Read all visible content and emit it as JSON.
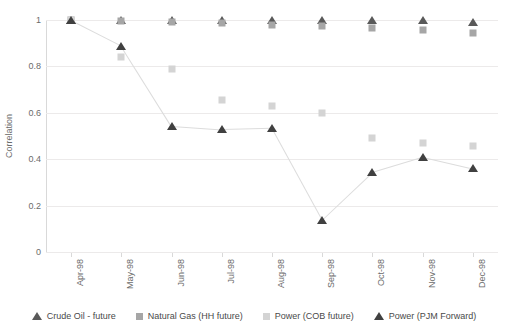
{
  "chart_data": {
    "type": "scatter",
    "title": "",
    "xlabel": "",
    "ylabel": "Correlation",
    "categories": [
      "Apr-98",
      "May-98",
      "Jun-98",
      "Jul-98",
      "Aug-98",
      "Sep-98",
      "Oct-98",
      "Nov-98",
      "Dec-98"
    ],
    "ylim": [
      0,
      1
    ],
    "yticks": [
      "0",
      "0.2",
      "0.4",
      "0.6",
      "0.8",
      "1"
    ],
    "ytick_values": [
      0,
      0.2,
      0.4,
      0.6,
      0.8,
      1
    ],
    "grid": true,
    "legend_position": "bottom",
    "series": [
      {
        "name": "Crude Oil - future",
        "marker": "triangle",
        "color": "#595959",
        "values": [
          1.0,
          1.0,
          1.0,
          1.0,
          1.0,
          1.0,
          1.0,
          1.0,
          0.99
        ]
      },
      {
        "name": "Natural Gas (HH future)",
        "marker": "square",
        "color": "#a6a6a6",
        "values": [
          1.0,
          0.995,
          0.99,
          0.985,
          0.98,
          0.975,
          0.965,
          0.955,
          0.945
        ]
      },
      {
        "name": "Power (COB future)",
        "marker": "square",
        "color": "#d4d4d4",
        "values": [
          1.0,
          0.84,
          0.79,
          0.655,
          0.63,
          0.6,
          0.49,
          0.47,
          0.455
        ]
      },
      {
        "name": "Power (PJM Forward)",
        "marker": "triangle",
        "color": "#404040",
        "values": [
          1.0,
          0.89,
          0.545,
          0.53,
          0.535,
          0.14,
          0.345,
          0.41,
          0.36
        ],
        "connected": true
      }
    ]
  },
  "colors": {
    "grid": "#eceaea",
    "axis": "#d9d9d9",
    "text": "#6b6b6b",
    "background": "#ffffff"
  }
}
